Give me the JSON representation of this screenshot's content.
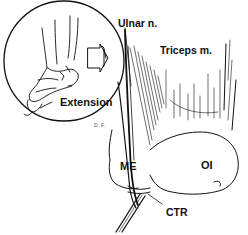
{
  "figure": {
    "type": "anatomical-illustration",
    "labels": {
      "ulnar_nerve": "Ulnar n.",
      "triceps": "Triceps m.",
      "extension": "Extension",
      "medial_epicondyle": "ME",
      "olecranon": "OI",
      "cubital_tunnel_retinaculum": "CTR",
      "signature": "D.F."
    },
    "colors": {
      "ink": "#111111",
      "background": "#ffffff"
    }
  }
}
